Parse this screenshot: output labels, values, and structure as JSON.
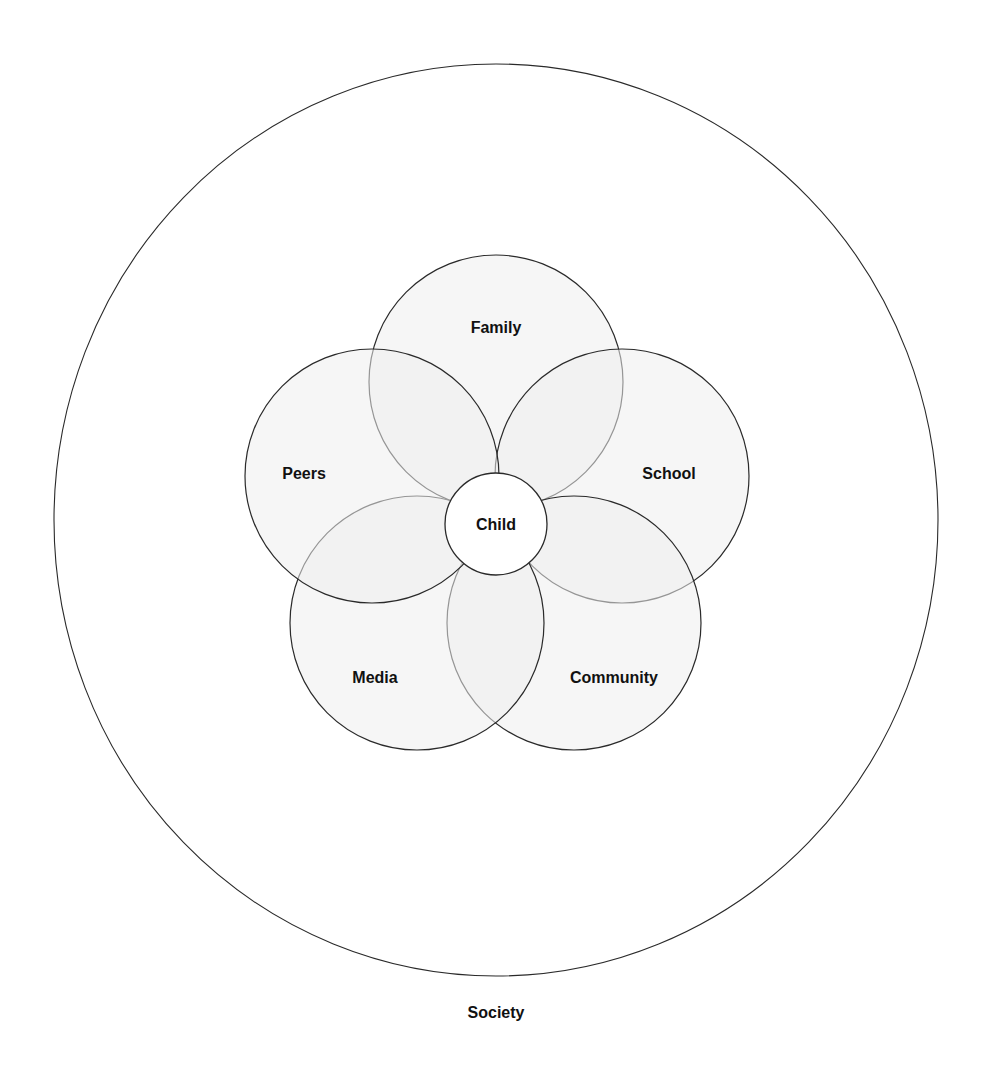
{
  "diagram": {
    "title": "",
    "outer": {
      "label": "Society",
      "cx": 496,
      "cy": 520,
      "rx": 442,
      "ry": 456,
      "label_x": 496,
      "label_y": 1018
    },
    "center": {
      "label": "Child",
      "cx": 496,
      "cy": 524,
      "r": 51
    },
    "petals": [
      {
        "label": "Family",
        "cx": 496,
        "cy": 382,
        "r": 127,
        "label_x": 496,
        "label_y": 333
      },
      {
        "label": "School",
        "cx": 622,
        "cy": 476,
        "r": 127,
        "label_x": 669,
        "label_y": 479
      },
      {
        "label": "Community",
        "cx": 574,
        "cy": 623,
        "r": 127,
        "label_x": 614,
        "label_y": 683
      },
      {
        "label": "Media",
        "cx": 417,
        "cy": 623,
        "r": 127,
        "label_x": 375,
        "label_y": 683
      },
      {
        "label": "Peers",
        "cx": 372,
        "cy": 476,
        "r": 127,
        "label_x": 304,
        "label_y": 479
      }
    ],
    "colors": {
      "petal_fill": "#efefef",
      "stroke": "#2a2a2a",
      "text": "#111111",
      "background": "#ffffff"
    }
  }
}
